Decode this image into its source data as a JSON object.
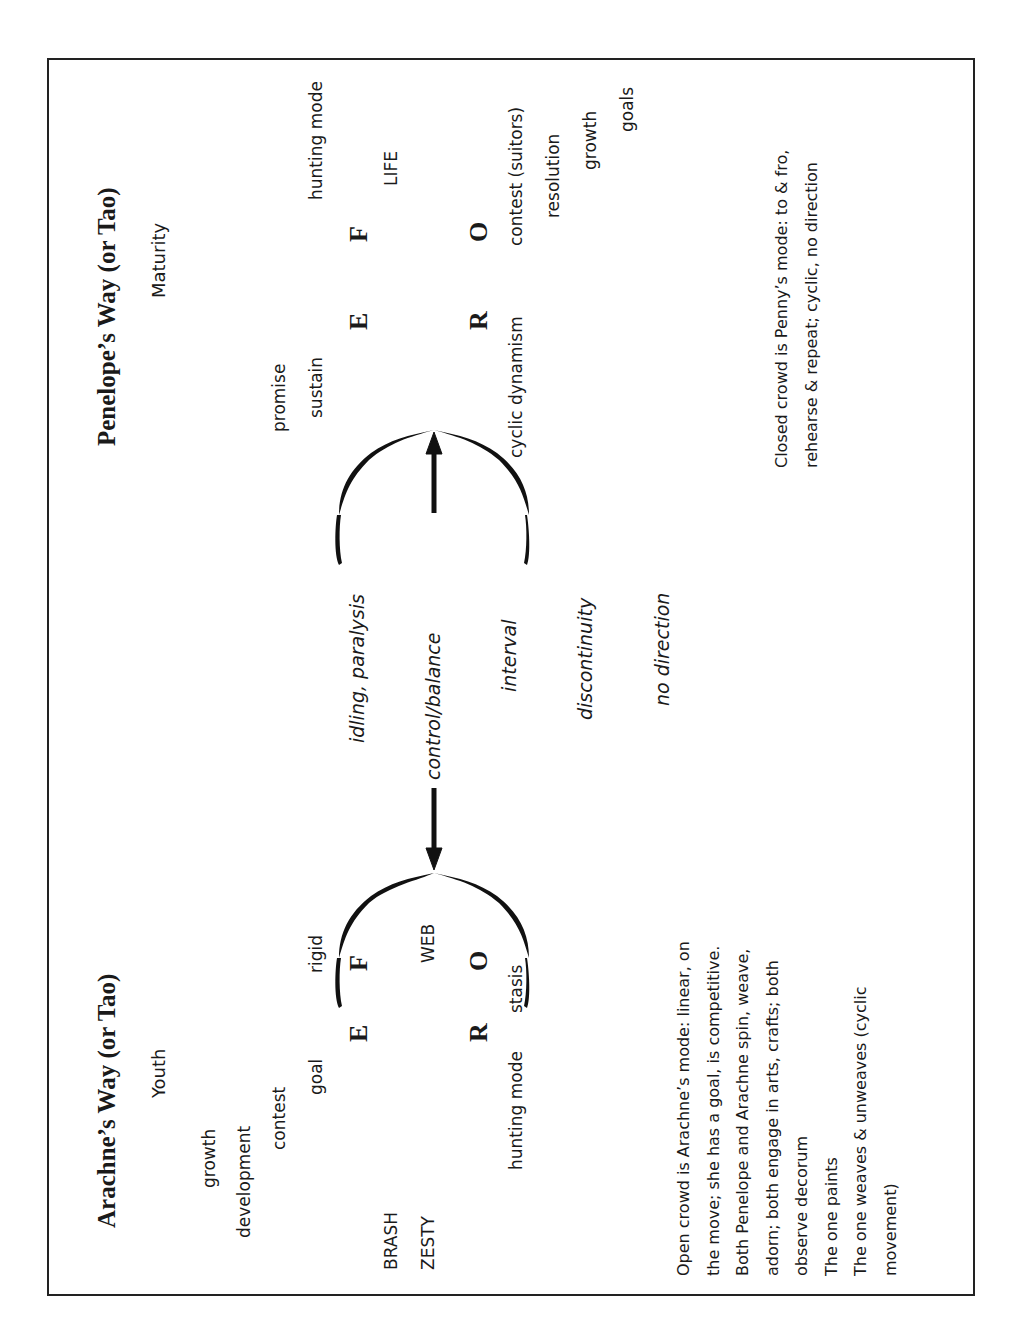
{
  "left_column": {
    "title": "Arachne’s Way (or Tao)",
    "subtitle": "Youth",
    "words": {
      "growth": "growth",
      "development": "development",
      "contest": "contest",
      "goal": "goal",
      "rigid": "rigid",
      "brash": "BRASH",
      "zesty": "ZESTY",
      "web": "WEB",
      "hunting_mode": "hunting mode",
      "stasis": "stasis"
    },
    "letters": {
      "e": "E",
      "f": "F",
      "r": "R",
      "o": "O"
    },
    "notes": [
      "Open crowd is Arachne’s mode: linear, on",
      "the move; she has a goal, is competitive.",
      "Both Penelope and Arachne spin, weave,",
      "adorn; both engage in arts, crafts; both",
      "observe decorum",
      "The one paints",
      "The one weaves & unweaves (cyclic",
      "movement)"
    ]
  },
  "center": {
    "idling": "idling, paralysis",
    "control": "control/balance",
    "interval": "interval",
    "discontinuity": "discontinuity",
    "no_direction": "no direction"
  },
  "right_column": {
    "title": "Penelope’s Way (or Tao)",
    "subtitle": "Maturity",
    "words": {
      "promise": "promise",
      "sustain": "sustain",
      "hunting_mode": "hunting mode",
      "life": "LIFE",
      "cyclic_dynamism": "cyclic dynamism",
      "contest_suitors": "contest (suitors)",
      "resolution": "resolution",
      "growth": "growth",
      "goals": "goals"
    },
    "letters": {
      "e": "E",
      "f": "F",
      "r": "R",
      "o": "O"
    },
    "notes": [
      "Closed crowd is Penny’s mode: to & fro,",
      "rehearse & repeat; cyclic, no direction"
    ]
  }
}
